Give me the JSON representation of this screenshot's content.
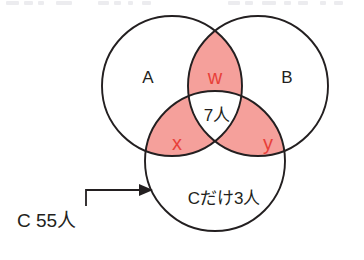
{
  "figure": {
    "type": "venn-diagram-3-set",
    "title": "",
    "background_color": "#ffffff",
    "outline_color": "#231f20",
    "fill_color": "#f5a09b",
    "variable_color": "#e8403a",
    "text_color": "#231f20"
  },
  "sets": {
    "a": {
      "label": "A",
      "cx": 172,
      "cy": 86,
      "r": 70
    },
    "b": {
      "label": "B",
      "cx": 258,
      "cy": 86,
      "r": 70
    },
    "c": {
      "label": "",
      "cx": 215,
      "cy": 161,
      "r": 70
    }
  },
  "regions": {
    "a_only": {
      "label": "A",
      "shaded": false,
      "x": 148,
      "y": 79
    },
    "b_only": {
      "label": "B",
      "shaded": false,
      "x": 287,
      "y": 79
    },
    "a_and_b": {
      "label": "w",
      "shaded": true,
      "x": 215,
      "y": 79
    },
    "a_and_c": {
      "label": "x",
      "shaded": true,
      "x": 177,
      "y": 145
    },
    "b_and_c": {
      "label": "y",
      "shaded": true,
      "x": 268,
      "y": 145
    },
    "a_b_and_c": {
      "label": "7人",
      "shaded": true,
      "x": 217,
      "y": 117
    },
    "c_only": {
      "label": "Cだけ3人",
      "shaded": false,
      "x": 224,
      "y": 200
    }
  },
  "callout": {
    "label": "C 55人",
    "label_x": 17,
    "label_y": 222,
    "arrow_path": "M 86 206 L 86 190 L 141 190",
    "arrow_head_points": "153,190 139,184 139,196"
  },
  "icons": {
    "arrow": "arrow-right-icon"
  }
}
